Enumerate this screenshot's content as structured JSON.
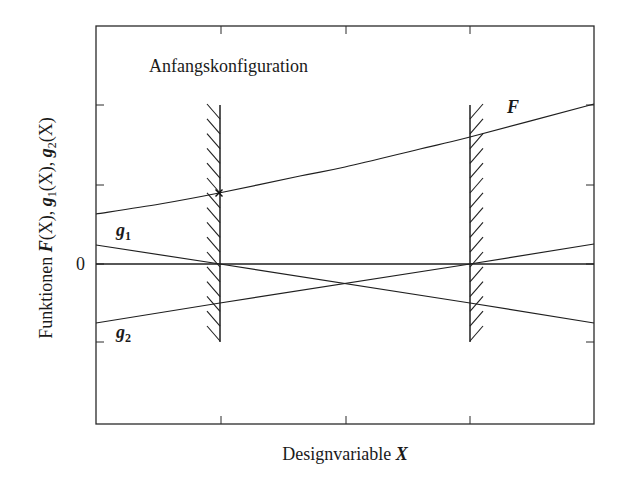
{
  "chart_data": {
    "type": "line",
    "title": "",
    "annotation": "Anfangskonfiguration",
    "xlabel": "Designvariable X",
    "ylabel": "Funktionen F(X), g1(X), g2(X)",
    "ytick_labels": [
      "0"
    ],
    "grid": false,
    "legend": "inline labels",
    "x_range": [
      0,
      1
    ],
    "constraint_boundaries": [
      {
        "name": "left-constraint",
        "x": 0.25,
        "hatch_side": "left"
      },
      {
        "name": "right-constraint",
        "x": 0.75,
        "hatch_side": "right"
      }
    ],
    "start_point": {
      "label": "Anfangskonfiguration",
      "x": 0.25,
      "series": "F"
    },
    "series": [
      {
        "name": "F",
        "label": "F",
        "x": [
          0,
          0.25,
          0.41,
          0.5,
          0.65,
          0.75,
          1.0
        ],
        "values": [
          0.64,
          0.91,
          1.13,
          1.24,
          1.47,
          1.62,
          2.04
        ]
      },
      {
        "name": "g1",
        "label": "g1",
        "x": [
          0,
          0.25,
          0.5,
          0.75,
          1.0
        ],
        "values": [
          0.24,
          0,
          -0.24,
          -0.48,
          -0.72
        ]
      },
      {
        "name": "g2",
        "label": "g2",
        "x": [
          0,
          0.25,
          0.5,
          0.75,
          1.0
        ],
        "values": [
          -0.72,
          -0.48,
          -0.24,
          0,
          0.24
        ]
      }
    ]
  },
  "labels": {
    "annotation": "Anfangskonfiguration",
    "F": "F",
    "g1_base": "g",
    "g1_sub": "1",
    "g2_base": "g",
    "g2_sub": "2",
    "zero": "0",
    "xlabel_text": "Designvariable ",
    "xlabel_var": "X",
    "ylabel_text": "Funktionen ",
    "ylabel_math": "F(X), g1(X), g2(X)",
    "ylabel_parts": [
      "F",
      "(X), ",
      "g",
      "1",
      "(X), ",
      "g",
      "2",
      "(X)"
    ]
  },
  "geometry": {
    "frame": {
      "x": 96,
      "y": 26,
      "w": 498,
      "h": 398
    },
    "zero_y": 264,
    "xticks_px": [
      221,
      346,
      470
    ],
    "yticks_px": [
      105,
      185,
      264,
      342
    ],
    "constraints_px": [
      {
        "x": 220,
        "y1": 105,
        "y2": 342,
        "dir": -1
      },
      {
        "x": 470,
        "y1": 105,
        "y2": 342,
        "dir": 1
      }
    ],
    "F_px": [
      [
        96,
        214
      ],
      [
        160,
        204
      ],
      [
        219,
        193
      ],
      [
        300,
        176
      ],
      [
        345,
        167
      ],
      [
        420,
        149
      ],
      [
        470,
        137
      ],
      [
        594,
        104
      ]
    ],
    "g1_px": [
      [
        96,
        245
      ],
      [
        220,
        264
      ],
      [
        470,
        303
      ],
      [
        594,
        323
      ]
    ],
    "g2_px": [
      [
        96,
        323
      ],
      [
        220,
        303
      ],
      [
        470,
        264
      ],
      [
        594,
        244
      ]
    ],
    "marker_px": [
      219,
      193
    ]
  }
}
